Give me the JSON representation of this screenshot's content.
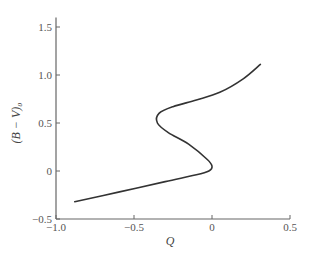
{
  "chart_data": {
    "type": "line",
    "title": "",
    "xlabel": "Q",
    "ylabel": "(B − V)₀",
    "xlim": [
      -1.0,
      0.5
    ],
    "ylim": [
      -0.5,
      1.6
    ],
    "grid": false,
    "legend": null,
    "xticks": [
      -1.0,
      -0.5,
      0,
      0.5
    ],
    "xtick_labels": [
      "−1.0",
      "−0.5",
      "0",
      "0.5"
    ],
    "yticks": [
      -0.5,
      0,
      0.5,
      1.0,
      1.5
    ],
    "ytick_labels": [
      "−0.5",
      "0",
      "0.5",
      "1.0",
      "1.5"
    ],
    "series": [
      {
        "name": "intrinsic Q vs (B-V)0 relation",
        "color": "#333333",
        "points": [
          [
            -0.88,
            -0.32
          ],
          [
            -0.6,
            -0.22
          ],
          [
            -0.3,
            -0.11
          ],
          [
            -0.1,
            -0.04
          ],
          [
            -0.02,
            0.0
          ],
          [
            0.0,
            0.05
          ],
          [
            -0.03,
            0.12
          ],
          [
            -0.15,
            0.28
          ],
          [
            -0.28,
            0.4
          ],
          [
            -0.35,
            0.5
          ],
          [
            -0.34,
            0.6
          ],
          [
            -0.25,
            0.67
          ],
          [
            -0.1,
            0.74
          ],
          [
            0.05,
            0.82
          ],
          [
            0.2,
            0.96
          ],
          [
            0.31,
            1.11
          ]
        ]
      }
    ]
  },
  "layout": {
    "plot_left": 56,
    "plot_bottom": 219,
    "px_per_x": 156,
    "px_per_y": 96,
    "x0": -1.0,
    "y0": -0.5,
    "axis_color": "#666666"
  }
}
